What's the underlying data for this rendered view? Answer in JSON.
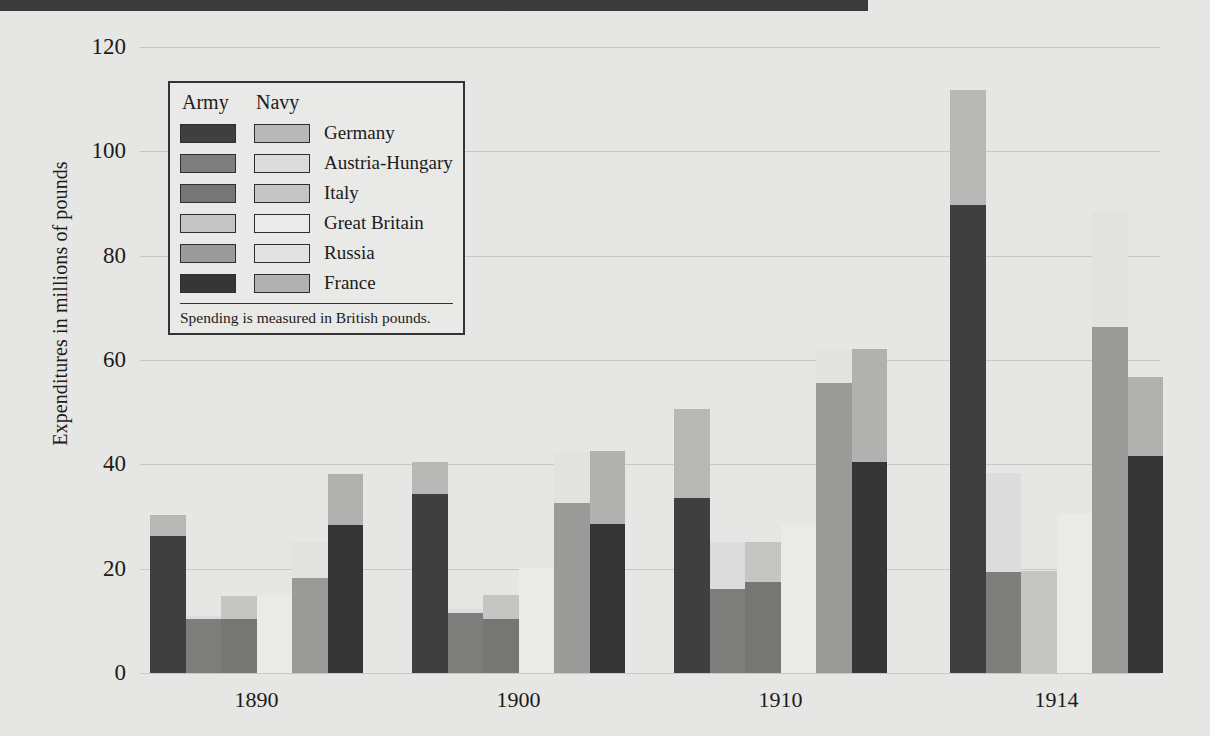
{
  "figure": {
    "ylabel": "Expenditures in millions of pounds",
    "top_rule_color": "#3a3a3a",
    "background_color": "#e8e8e6",
    "gridline_color": "#c9c9c7"
  },
  "legend": {
    "header_army": "Army",
    "header_navy": "Navy",
    "note": "Spending is measured in British pounds.",
    "rows": [
      {
        "country": "Germany",
        "army_color": "#3f3f3f",
        "navy_color": "#b9b9b7"
      },
      {
        "country": "Austria-Hungary",
        "army_color": "#7e7e7c",
        "navy_color": "#dedede"
      },
      {
        "country": "Italy",
        "army_color": "#767674",
        "navy_color": "#c6c6c4"
      },
      {
        "country": "Great Britain",
        "army_color": "#c6c6c4",
        "navy_color": "#ececea"
      },
      {
        "country": "Russia",
        "army_color": "#9b9b99",
        "navy_color": "#e4e4e2"
      },
      {
        "country": "France",
        "army_color": "#353535",
        "navy_color": "#b2b2b0"
      }
    ]
  },
  "chart_data": {
    "type": "bar",
    "stacked": true,
    "title": "",
    "xlabel": "",
    "ylabel": "Expenditures in millions of pounds",
    "categories": [
      "1890",
      "1900",
      "1910",
      "1914"
    ],
    "ylim": [
      0,
      120
    ],
    "yticks": [
      0,
      20,
      40,
      60,
      80,
      100,
      120
    ],
    "grid": true,
    "legend_position": "upper-left-inside",
    "countries": [
      "Germany",
      "Austria-Hungary",
      "Italy",
      "Great Britain",
      "Russia",
      "France"
    ],
    "series": [
      {
        "name": "Army",
        "values": {
          "1890": [
            26.2,
            10.4,
            10.4,
            0.0,
            18.3,
            28.3
          ],
          "1900": [
            34.4,
            11.5,
            10.4,
            0.0,
            32.5,
            28.5
          ],
          "1910": [
            33.6,
            16.2,
            17.4,
            0.0,
            55.6,
            40.5
          ],
          "1914": [
            89.8,
            19.4,
            0.0,
            0.0,
            66.4,
            41.6
          ]
        }
      },
      {
        "name": "Navy",
        "values": {
          "1890": [
            4.0,
            0.6,
            4.3,
            15.0,
            6.9,
            9.8
          ],
          "1900": [
            6.0,
            0.7,
            4.5,
            20.1,
            9.8,
            14.0
          ],
          "1910": [
            17.0,
            8.9,
            7.7,
            28.4,
            6.6,
            21.6
          ],
          "1914": [
            22.0,
            19.0,
            19.5,
            30.4,
            22.2,
            15.1
          ]
        }
      }
    ],
    "totals": {
      "1890": [
        30.2,
        11.0,
        14.7,
        15.0,
        25.2,
        38.1
      ],
      "1900": [
        40.4,
        12.2,
        14.9,
        20.1,
        42.3,
        42.5
      ],
      "1910": [
        50.6,
        25.1,
        25.1,
        28.4,
        62.2,
        62.1
      ],
      "1914": [
        111.8,
        38.4,
        19.5,
        30.4,
        88.6,
        56.7
      ]
    }
  }
}
